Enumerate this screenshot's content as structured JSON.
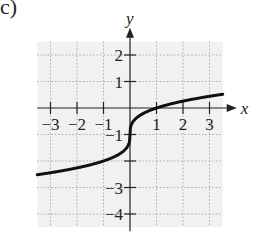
{
  "figure_label": "c)",
  "chart_data": {
    "type": "line",
    "title": "",
    "xlabel": "x",
    "ylabel": "y",
    "xlim": [
      -3.5,
      3.5
    ],
    "ylim": [
      -4.5,
      2.5
    ],
    "x_ticks": [
      "-3",
      "-2",
      "-1",
      "1",
      "2",
      "3"
    ],
    "y_ticks": [
      "2",
      "1",
      "-1",
      "-3",
      "-4"
    ],
    "grid": true,
    "series": [
      {
        "name": "curve",
        "x": [
          -3.5,
          -3,
          -2,
          -1,
          -0.5,
          -0.125,
          0,
          0.125,
          0.5,
          1,
          2,
          3,
          3.5
        ],
        "values": [
          -2.52,
          -2.44,
          -2.26,
          -2.0,
          -1.79,
          -1.5,
          -1.0,
          -0.5,
          -0.21,
          0,
          0.26,
          0.44,
          0.52
        ]
      }
    ],
    "color": "#111111",
    "grid_color": "#999999"
  }
}
